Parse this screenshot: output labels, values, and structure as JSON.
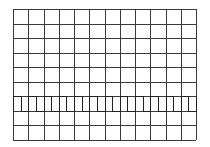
{
  "chart_data": {
    "type": "line",
    "title": "",
    "xlabel": "",
    "ylabel": "",
    "grid": true,
    "legend": null,
    "grid_divisions": {
      "columns": 12,
      "rows": 9
    },
    "plot_area_px": {
      "left": 13,
      "top": 9,
      "width": 183,
      "height": 131
    },
    "series": [
      {
        "name": "square-wave",
        "shape": "square",
        "duty_cycle": 0.5,
        "periods": 12,
        "period_divisions": 1,
        "high_row_line": 6,
        "low_row_line": 7,
        "x": [
          0,
          0.5,
          1,
          1.5,
          2,
          2.5,
          3,
          3.5,
          4,
          4.5,
          5,
          5.5,
          6,
          6.5,
          7,
          7.5,
          8,
          8.5,
          9,
          9.5,
          10,
          10.5,
          11,
          11.5,
          12
        ],
        "values": [
          1,
          0,
          1,
          0,
          1,
          0,
          1,
          0,
          1,
          0,
          1,
          0,
          1,
          0,
          1,
          0,
          1,
          0,
          1,
          0,
          1,
          0,
          1,
          0,
          1
        ]
      }
    ],
    "colors": {
      "grid": "#3a3a3a",
      "trace": "#222222",
      "background": "#ffffff"
    }
  }
}
